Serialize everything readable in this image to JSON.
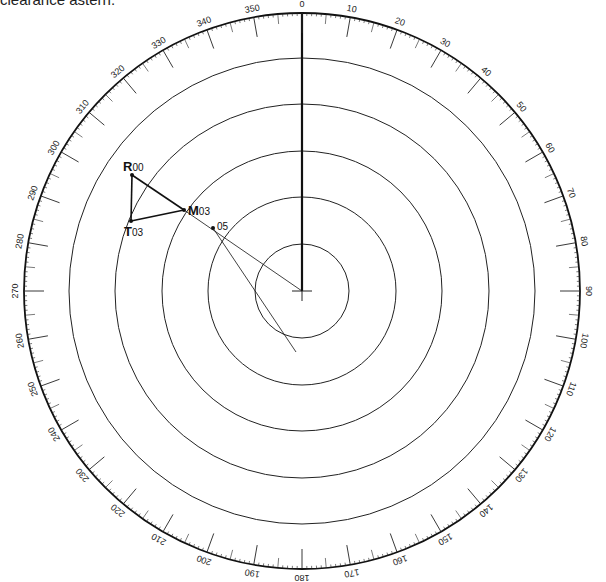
{
  "caption": "clearance astern.",
  "plot": {
    "center": [
      302,
      291
    ],
    "outer_radius": 278,
    "range_rings": [
      47,
      94,
      140,
      187,
      233
    ],
    "bearing_labels_step": 10,
    "heading_line": {
      "from": [
        302,
        291
      ],
      "to": [
        302,
        13
      ]
    }
  },
  "points": [
    {
      "id": "R00",
      "letter": "R",
      "sub": "00",
      "x": 132,
      "y": 175,
      "lx": 123,
      "ly": 171
    },
    {
      "id": "T03",
      "letter": "T",
      "sub": "03",
      "x": 131,
      "y": 221,
      "lx": 124,
      "ly": 236
    },
    {
      "id": "M03",
      "letter": "M",
      "sub": "03",
      "x": 184,
      "y": 210,
      "lx": 188,
      "ly": 215
    },
    {
      "id": "05",
      "letter": "",
      "sub": "05",
      "x": 213,
      "y": 228,
      "lx": 217,
      "ly": 230
    }
  ],
  "lines": [
    {
      "name": "r-to-t",
      "from": [
        132,
        175
      ],
      "to": [
        131,
        221
      ],
      "w": 1.6
    },
    {
      "name": "t-to-m",
      "from": [
        131,
        221
      ],
      "to": [
        184,
        210
      ],
      "w": 1.6
    },
    {
      "name": "r-to-m",
      "from": [
        132,
        175
      ],
      "to": [
        184,
        210
      ],
      "w": 1.6
    },
    {
      "name": "m-to-center",
      "from": [
        184,
        210
      ],
      "to": [
        302,
        291
      ],
      "w": 0.8
    },
    {
      "name": "o5-to-cpa",
      "from": [
        213,
        228
      ],
      "to": [
        296,
        352
      ],
      "w": 0.8
    }
  ]
}
